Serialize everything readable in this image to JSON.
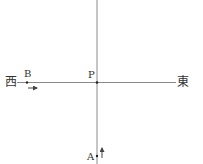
{
  "diagram": {
    "labels": {
      "west": "西",
      "east": "東",
      "point_p": "P",
      "point_a": "A",
      "point_b": "B"
    },
    "colors": {
      "line": "#8a8a8a",
      "text": "#333333",
      "dot": "#222222"
    }
  }
}
